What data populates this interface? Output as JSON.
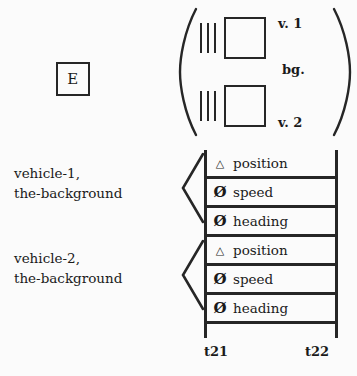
{
  "figure": {
    "background_color": "#fbfbfb",
    "ink_color": "#262626"
  },
  "event_box": {
    "label": "E",
    "name": "event-box"
  },
  "matrix": {
    "open_paren": "(",
    "close_paren": ")",
    "rows": [
      {
        "bars": "|||",
        "box": "",
        "label": "v. 1"
      },
      {
        "bars": "|||",
        "box": "",
        "label": "v. 2"
      }
    ],
    "side_label": "bg."
  },
  "groups": [
    {
      "caption_line_1": "vehicle-1,",
      "caption_line_2": "the-background",
      "bracket": "<"
    },
    {
      "caption_line_1": "vehicle-2,",
      "caption_line_2": "the-background",
      "bracket": "<"
    }
  ],
  "timeline": {
    "rows": [
      {
        "symbol": "△",
        "symbol_name": "triangle-symbol",
        "label": "position"
      },
      {
        "symbol": "Ø",
        "symbol_name": "slashed-zero-symbol",
        "label": "speed"
      },
      {
        "symbol": "Ø",
        "symbol_name": "slashed-zero-symbol",
        "label": "heading"
      },
      {
        "symbol": "△",
        "symbol_name": "triangle-symbol",
        "label": "position"
      },
      {
        "symbol": "Ø",
        "symbol_name": "slashed-zero-symbol",
        "label": "speed"
      },
      {
        "symbol": "Ø",
        "symbol_name": "slashed-zero-symbol",
        "label": "heading"
      }
    ],
    "tick_start": "t21",
    "tick_end": "t22"
  }
}
